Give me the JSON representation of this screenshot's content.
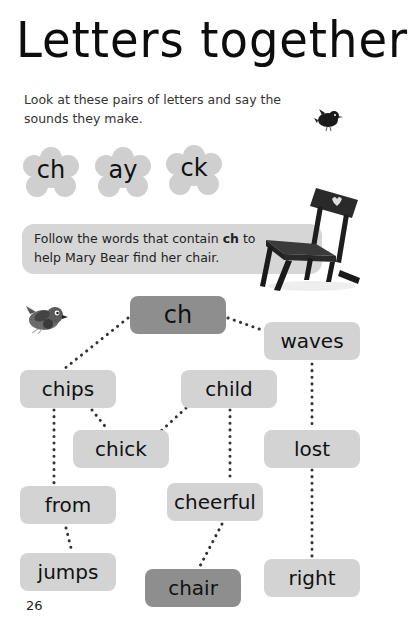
{
  "page": {
    "title": "Letters together",
    "intro": "Look at these pairs of letters and say the sounds they make.",
    "page_number": "26"
  },
  "flowers": [
    {
      "label": "ch"
    },
    {
      "label": "ay"
    },
    {
      "label": "ck"
    }
  ],
  "instruction": {
    "before": "Follow the words that contain ",
    "highlight": "ch",
    "after": " to help Mary Bear find her chair."
  },
  "maze": {
    "start": "ch",
    "words": [
      "waves",
      "chips",
      "child",
      "chick",
      "lost",
      "from",
      "cheerful",
      "jumps",
      "chair",
      "right"
    ],
    "goal": "chair"
  },
  "colors": {
    "box": "#d3d3d3",
    "highlight_box": "#8e8e8e",
    "flower": "#cfcfcf",
    "banner": "#d6d6d6",
    "dots": "#333333"
  },
  "icons": [
    "bird-icon",
    "chair-illustration-icon",
    "flower-icon"
  ]
}
